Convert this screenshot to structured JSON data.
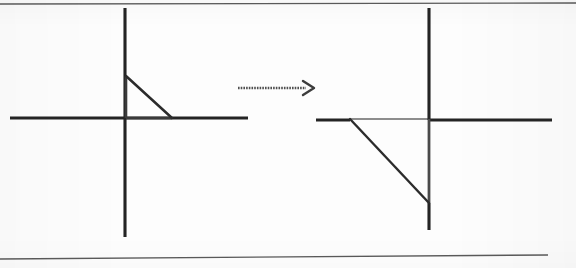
{
  "page": {
    "width": 576,
    "height": 268,
    "background_color": "#fdfdfd",
    "ink_color": "#2b2b2b",
    "faded_ink_color": "#6e6e6e",
    "rule_color": "#555555"
  },
  "rules": {
    "top_rule": {
      "x1": 0,
      "y1": 4,
      "x2": 576,
      "y2": 3
    },
    "bottom_rule": {
      "x1": 0,
      "y1": 259,
      "x2": 548,
      "y2": 255
    }
  },
  "figures": [
    {
      "id": "left-figure",
      "label": "pre-image",
      "axes": {
        "x_axis": {
          "x1": 10,
          "y1": 118,
          "x2": 248,
          "y2": 118
        },
        "y_axis": {
          "x1": 125,
          "y1": 8,
          "x2": 125,
          "y2": 237
        },
        "origin": {
          "x": 125,
          "y": 118
        }
      },
      "triangle": {
        "name": "small-right-triangle",
        "vertices": [
          {
            "label": "apex-on-y-axis",
            "x": 126,
            "y": 76
          },
          {
            "label": "origin-corner",
            "x": 126,
            "y": 118
          },
          {
            "label": "foot-on-x-axis",
            "x": 172,
            "y": 118
          }
        ],
        "legs": {
          "vertical": 42,
          "horizontal": 46
        },
        "right_angle_at": "origin-corner",
        "drawn_edges": [
          "apex-to-foot"
        ],
        "edge_style": "solid"
      }
    },
    {
      "id": "right-figure",
      "label": "image",
      "axes": {
        "x_axis": {
          "x1": 316,
          "y1": 120,
          "x2": 552,
          "y2": 120
        },
        "y_axis": {
          "x1": 429,
          "y1": 8,
          "x2": 429,
          "y2": 230
        },
        "origin": {
          "x": 429,
          "y": 120
        }
      },
      "triangle": {
        "name": "large-right-triangle",
        "vertices": [
          {
            "label": "left-on-x-axis",
            "x": 350,
            "y": 119
          },
          {
            "label": "origin-corner",
            "x": 429,
            "y": 119
          },
          {
            "label": "foot-on-y-axis",
            "x": 429,
            "y": 203
          }
        ],
        "legs": {
          "horizontal": 79,
          "vertical": 84
        },
        "right_angle_at": "origin-corner",
        "drawn_edges": [
          "left-to-foot",
          "top-leg-faded"
        ],
        "edge_style": "solid"
      }
    }
  ],
  "arrow": {
    "name": "transformation-arrow",
    "direction": "right",
    "shaft": {
      "x1": 238,
      "y1": 88,
      "x2": 306,
      "y2": 88
    },
    "head_tip": {
      "x": 314,
      "y": 88
    },
    "style": "dotted-shaft-open-head"
  }
}
